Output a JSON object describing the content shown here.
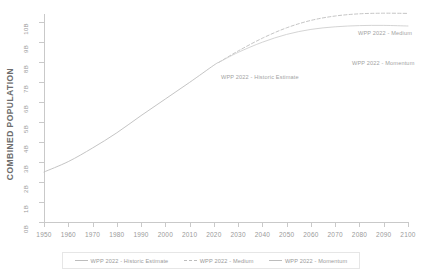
{
  "chart_data": {
    "type": "line",
    "title": "",
    "xlabel": "",
    "ylabel": "COMBINED POPULATION",
    "xlim": [
      1950,
      2100
    ],
    "ylim": [
      0,
      10
    ],
    "grid": false,
    "legend_position": "bottom",
    "y_tick_labels": [
      "10B",
      "9B",
      "8B",
      "7B",
      "6B",
      "5B",
      "4B",
      "3B",
      "2B",
      "1B",
      "0B"
    ],
    "y_tick_values": [
      10,
      9,
      8,
      7,
      6,
      5,
      4,
      3,
      2,
      1,
      0
    ],
    "x_tick_labels": [
      "1950",
      "1960",
      "1970",
      "1980",
      "1990",
      "2000",
      "2010",
      "2020",
      "2030",
      "2040",
      "2050",
      "2060",
      "2070",
      "2080",
      "2090",
      "2100"
    ],
    "x_tick_values": [
      1950,
      1960,
      1970,
      1980,
      1990,
      2000,
      2010,
      2020,
      2030,
      2040,
      2050,
      2060,
      2070,
      2080,
      2090,
      2100
    ],
    "series": [
      {
        "name": "WPP 2022 - Historic Estimate",
        "style": "solid",
        "color": "#bdbdbd",
        "x": [
          1950,
          1960,
          1970,
          1980,
          1990,
          2000,
          2010,
          2020,
          2022
        ],
        "values": [
          2.5,
          3.02,
          3.7,
          4.46,
          5.32,
          6.15,
          6.98,
          7.84,
          7.98
        ]
      },
      {
        "name": "WPP 2022 - Medium",
        "style": "dashed",
        "color": "#bdbdbd",
        "x": [
          2022,
          2030,
          2040,
          2050,
          2060,
          2070,
          2080,
          2090,
          2100
        ],
        "values": [
          7.98,
          8.55,
          9.19,
          9.71,
          10.08,
          10.3,
          10.41,
          10.44,
          10.43
        ]
      },
      {
        "name": "WPP 2022 - Momentum",
        "style": "solid",
        "color": "#cfcfcf",
        "x": [
          2022,
          2030,
          2040,
          2050,
          2060,
          2070,
          2080,
          2090,
          2100
        ],
        "values": [
          7.98,
          8.48,
          8.99,
          9.38,
          9.63,
          9.76,
          9.82,
          9.83,
          9.8
        ]
      }
    ],
    "annotations": [
      {
        "text": "WPP 2022 - Historic Estimate",
        "x": 2003,
        "y": 6.6
      },
      {
        "text": "WPP 2022 - Medium",
        "x": 2080,
        "y": 9.4
      },
      {
        "text": "WPP 2022 - Momentum",
        "x": 2077,
        "y": 7.9
      }
    ]
  },
  "axis": {
    "y_title": "COMBINED POPULATION"
  },
  "legend": {
    "items": [
      {
        "label": "WPP 2022 - Historic Estimate",
        "style": "solid"
      },
      {
        "label": "WPP 2022 - Medium",
        "style": "dashed"
      },
      {
        "label": "WPP 2022 - Momentum",
        "style": "solid"
      }
    ]
  }
}
